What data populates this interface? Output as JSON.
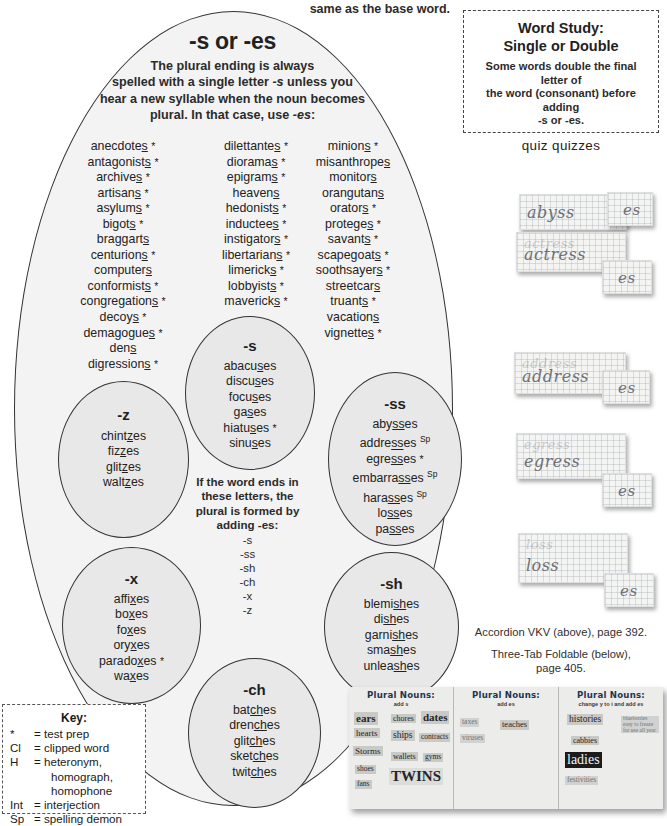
{
  "top_fragment": "same as the base word.",
  "main": {
    "title": "-s or -es",
    "description_lines": [
      "The plural ending is always",
      "spelled with a single letter -s unless you",
      "hear a new syllable when the noun becomes",
      "plural.  In that case, use -es:"
    ],
    "columns": [
      {
        "name": "column-1",
        "words": [
          {
            "text": "anecdote",
            "underline": "s",
            "mark": "*"
          },
          {
            "text": "antagonist",
            "underline": "s",
            "mark": "*"
          },
          {
            "text": "archive",
            "underline": "s",
            "mark": "*"
          },
          {
            "text": "artisan",
            "underline": "s",
            "mark": "*"
          },
          {
            "text": "asylum",
            "underline": "s",
            "mark": "*"
          },
          {
            "text": "bigot",
            "underline": "s",
            "mark": "*"
          },
          {
            "text": "braggart",
            "underline": "s",
            "mark": ""
          },
          {
            "text": "centurion",
            "underline": "s",
            "mark": "*"
          },
          {
            "text": "computer",
            "underline": "s",
            "mark": ""
          },
          {
            "text": "conformist",
            "underline": "s",
            "mark": "*"
          },
          {
            "text": "congregation",
            "underline": "s",
            "mark": "*"
          },
          {
            "text": "decoy",
            "underline": "s",
            "mark": "*"
          },
          {
            "text": "demagogue",
            "underline": "s",
            "mark": "*"
          },
          {
            "text": "den",
            "underline": "s",
            "mark": ""
          },
          {
            "text": "digression",
            "underline": "s",
            "mark": "*"
          }
        ]
      },
      {
        "name": "column-2",
        "words": [
          {
            "text": "dilettante",
            "underline": "s",
            "mark": "*"
          },
          {
            "text": "diorama",
            "underline": "s",
            "mark": "*"
          },
          {
            "text": "epigram",
            "underline": "s",
            "mark": "*"
          },
          {
            "text": "heaven",
            "underline": "s",
            "mark": ""
          },
          {
            "text": "hedonist",
            "underline": "s",
            "mark": "*"
          },
          {
            "text": "inductee",
            "underline": "s",
            "mark": "*"
          },
          {
            "text": "instigator",
            "underline": "s",
            "mark": "*"
          },
          {
            "text": "libertarian",
            "underline": "s",
            "mark": "*"
          },
          {
            "text": "limerick",
            "underline": "s",
            "mark": "*"
          },
          {
            "text": "lobbyist",
            "underline": "s",
            "mark": "*"
          },
          {
            "text": "maverick",
            "underline": "s",
            "mark": "*"
          }
        ]
      },
      {
        "name": "column-3",
        "words": [
          {
            "text": "minion",
            "underline": "s",
            "mark": "*"
          },
          {
            "text": "misanthrope",
            "underline": "s",
            "mark": ""
          },
          {
            "text": "monitor",
            "underline": "s",
            "mark": ""
          },
          {
            "text": "orangutan",
            "underline": "s",
            "mark": ""
          },
          {
            "text": "orator",
            "underline": "s",
            "mark": "*"
          },
          {
            "text": "protege",
            "underline": "s",
            "mark": "*"
          },
          {
            "text": "savant",
            "underline": "s",
            "mark": "*"
          },
          {
            "text": "scapegoat",
            "underline": "s",
            "mark": "*"
          },
          {
            "text": "soothsayer",
            "underline": "s",
            "mark": "*"
          },
          {
            "text": "streetcar",
            "underline": "s",
            "mark": ""
          },
          {
            "text": "truant",
            "underline": "s",
            "mark": "*"
          },
          {
            "text": "vacation",
            "underline": "s",
            "mark": ""
          },
          {
            "text": "vignette",
            "underline": "s",
            "mark": "*"
          }
        ]
      }
    ],
    "center_rule": {
      "lines": [
        "If the word ends in",
        "these letters, the",
        "plural is formed by",
        "adding -es:"
      ],
      "letters": [
        "-s",
        "-ss",
        "-sh",
        "-ch",
        "-x",
        "-z"
      ]
    },
    "circles": [
      {
        "id": "circle-s",
        "title": "-s",
        "words": [
          {
            "pre": "abacu",
            "underline": "s",
            "post": "es",
            "mark": ""
          },
          {
            "pre": "discu",
            "underline": "s",
            "post": "es",
            "mark": ""
          },
          {
            "pre": "focu",
            "underline": "s",
            "post": "es",
            "mark": ""
          },
          {
            "pre": "ga",
            "underline": "s",
            "post": "es",
            "mark": ""
          },
          {
            "pre": "hiatu",
            "underline": "s",
            "post": "es",
            "mark": "*"
          },
          {
            "pre": "sinu",
            "underline": "s",
            "post": "es",
            "mark": ""
          }
        ]
      },
      {
        "id": "circle-z",
        "title": "-z",
        "words": [
          {
            "pre": "chint",
            "underline": "z",
            "post": "es",
            "mark": ""
          },
          {
            "pre": "fiz",
            "underline": "z",
            "post": "es",
            "mark": ""
          },
          {
            "pre": "glit",
            "underline": "z",
            "post": "es",
            "mark": ""
          },
          {
            "pre": "walt",
            "underline": "z",
            "post": "es",
            "mark": ""
          }
        ]
      },
      {
        "id": "circle-ss",
        "title": "-ss",
        "words": [
          {
            "pre": "aby",
            "underline": "ss",
            "post": "es",
            "mark": ""
          },
          {
            "pre": "addre",
            "underline": "ss",
            "post": "es",
            "mark": "Sp"
          },
          {
            "pre": "egre",
            "underline": "ss",
            "post": "es",
            "mark": "*"
          },
          {
            "pre": "embarra",
            "underline": "ss",
            "post": "es",
            "mark": "Sp"
          },
          {
            "pre": "hara",
            "underline": "ss",
            "post": "es",
            "mark": "Sp"
          },
          {
            "pre": "lo",
            "underline": "ss",
            "post": "es",
            "mark": ""
          },
          {
            "pre": "pa",
            "underline": "ss",
            "post": "es",
            "mark": ""
          }
        ]
      },
      {
        "id": "circle-x",
        "title": "-x",
        "words": [
          {
            "pre": "affi",
            "underline": "x",
            "post": "es",
            "mark": ""
          },
          {
            "pre": "bo",
            "underline": "x",
            "post": "es",
            "mark": ""
          },
          {
            "pre": "fo",
            "underline": "x",
            "post": "es",
            "mark": ""
          },
          {
            "pre": "ory",
            "underline": "x",
            "post": "es",
            "mark": ""
          },
          {
            "pre": "parado",
            "underline": "x",
            "post": "es",
            "mark": "*"
          },
          {
            "pre": "wa",
            "underline": "x",
            "post": "es",
            "mark": ""
          }
        ]
      },
      {
        "id": "circle-sh",
        "title": "-sh",
        "words": [
          {
            "pre": "blemi",
            "underline": "sh",
            "post": "es",
            "mark": ""
          },
          {
            "pre": "di",
            "underline": "sh",
            "post": "es",
            "mark": ""
          },
          {
            "pre": "garni",
            "underline": "sh",
            "post": "es",
            "mark": ""
          },
          {
            "pre": "sma",
            "underline": "sh",
            "post": "es",
            "mark": ""
          },
          {
            "pre": "unlea",
            "underline": "sh",
            "post": "es",
            "mark": ""
          }
        ]
      },
      {
        "id": "circle-ch",
        "title": "-ch",
        "words": [
          {
            "pre": "bat",
            "underline": "ch",
            "post": "es",
            "mark": ""
          },
          {
            "pre": "dren",
            "underline": "ch",
            "post": "es",
            "mark": ""
          },
          {
            "pre": "glit",
            "underline": "ch",
            "post": "es",
            "mark": ""
          },
          {
            "pre": "sket",
            "underline": "ch",
            "post": "es",
            "mark": ""
          },
          {
            "pre": "twit",
            "underline": "ch",
            "post": "es",
            "mark": ""
          }
        ]
      }
    ]
  },
  "key_box": {
    "title": "Key:",
    "rows": [
      {
        "symbol": "*",
        "definition": "= test prep",
        "continuation": []
      },
      {
        "symbol": "Cl",
        "definition": "= clipped word",
        "continuation": []
      },
      {
        "symbol": "H",
        "definition": "= heteronym,",
        "continuation": [
          "homograph,",
          "homophone"
        ]
      },
      {
        "symbol": "Int",
        "definition": "= interjection",
        "continuation": []
      },
      {
        "symbol": "Sp",
        "definition": "= spelling demon",
        "continuation": []
      }
    ]
  },
  "word_study": {
    "title_line_1": "Word Study:",
    "title_line_2": "Single or Double",
    "body_lines": [
      "Some words double the final letter of",
      "the word (consonant) before adding",
      "-s or -es."
    ],
    "example": "quiz   quizzes"
  },
  "vkv_cards": [
    {
      "base": "abyss",
      "suffix": "es",
      "ghost": ""
    },
    {
      "base": "actress",
      "suffix": "es",
      "ghost": "actress"
    },
    {
      "base": "address",
      "suffix": "es",
      "ghost": "address"
    },
    {
      "base": "egress",
      "suffix": "es",
      "ghost": "egress"
    },
    {
      "base": "loss",
      "suffix": "es",
      "ghost": "loss"
    }
  ],
  "captions": {
    "line_1": "Accordion VKV (above), page 392.",
    "line_2a": "Three-Tab Foldable (below),",
    "line_2b": "page 405."
  },
  "foldable": {
    "panels": [
      {
        "title": "Plural Nouns:",
        "subtitle": "add s",
        "chips": [
          {
            "text": "ears",
            "style": "big"
          },
          {
            "text": "hearts",
            "style": "normal"
          },
          {
            "text": "Storms",
            "style": "normal"
          },
          {
            "text": "shoes",
            "style": "small"
          },
          {
            "text": "fans",
            "style": "small"
          },
          {
            "text": "chores",
            "style": "normal"
          },
          {
            "text": "dates",
            "style": "big"
          },
          {
            "text": "ships",
            "style": "normal"
          },
          {
            "text": "contracts",
            "style": "small"
          },
          {
            "text": "wallets",
            "style": "normal"
          },
          {
            "text": "gyms",
            "style": "small"
          },
          {
            "text": "TWINS",
            "style": "huge"
          }
        ]
      },
      {
        "title": "Plural Nouns:",
        "subtitle": "add es",
        "chips": [
          {
            "text": "taxes",
            "style": "faint"
          },
          {
            "text": "viruses",
            "style": "faint"
          },
          {
            "text": "teaches",
            "style": "normal"
          }
        ]
      },
      {
        "title": "Plural Nouns:",
        "subtitle": "change y to i and add es",
        "chips": [
          {
            "text": "histories",
            "style": "normal"
          },
          {
            "text": "blueberries easy to freeze for use all year",
            "style": "faint"
          },
          {
            "text": "cabbies",
            "style": "normal"
          },
          {
            "text": "ladies",
            "style": "dark"
          },
          {
            "text": "festivities",
            "style": "faint"
          }
        ]
      }
    ]
  }
}
